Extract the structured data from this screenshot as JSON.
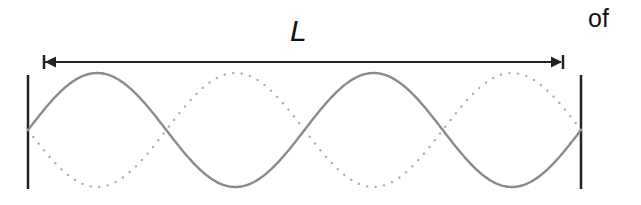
{
  "diagram": {
    "length_label": "L",
    "trailing_text": "of",
    "colors": {
      "wall": "#222222",
      "arrow": "#222222",
      "solid_wave": "#8a8a8a",
      "dotted_wave": "#b0b0b0"
    },
    "elements": [
      {
        "name": "left-wall"
      },
      {
        "name": "right-wall"
      },
      {
        "name": "length-arrow",
        "label": "L"
      },
      {
        "name": "solid-wave",
        "style": "solid"
      },
      {
        "name": "dotted-wave",
        "style": "dotted"
      }
    ]
  }
}
